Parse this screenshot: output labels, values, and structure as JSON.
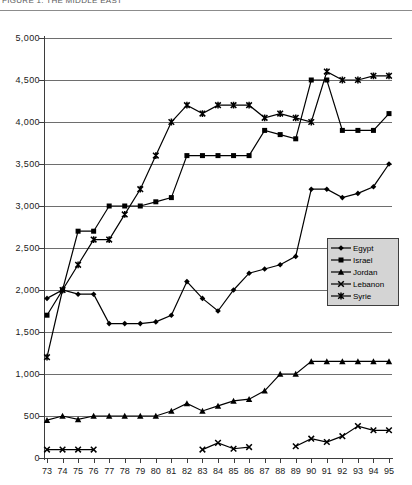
{
  "header": {
    "clipped_title": "FIGURE 1.  THE MIDDLE EAST"
  },
  "legend": {
    "position": "inside-right",
    "items": [
      {
        "label": "Egypt",
        "marker": "diamond-marker"
      },
      {
        "label": "Israel",
        "marker": "square-marker"
      },
      {
        "label": "Jordan",
        "marker": "triangle-marker"
      },
      {
        "label": "Lebanon",
        "marker": "cross-x-marker"
      },
      {
        "label": "Syrie",
        "marker": "asterisk-marker"
      }
    ]
  },
  "chart_data": {
    "type": "line",
    "title": "",
    "xlabel": "",
    "ylabel": "",
    "grid": true,
    "legend_position": "inside-right",
    "xlim": [
      73,
      95
    ],
    "ylim": [
      0,
      5000
    ],
    "ytick_step": 500,
    "ytick_labels": [
      "0",
      "500",
      "1,000",
      "1,500",
      "2,000",
      "2,500",
      "3,000",
      "3,500",
      "4,000",
      "4,500",
      "5,000"
    ],
    "ytick_values": [
      0,
      500,
      1000,
      1500,
      2000,
      2500,
      3000,
      3500,
      4000,
      4500,
      5000
    ],
    "categories": [
      "73",
      "74",
      "75",
      "76",
      "77",
      "78",
      "79",
      "80",
      "81",
      "82",
      "83",
      "84",
      "85",
      "86",
      "87",
      "88",
      "89",
      "90",
      "91",
      "92",
      "93",
      "94",
      "95"
    ],
    "x": [
      73,
      74,
      75,
      76,
      77,
      78,
      79,
      80,
      81,
      82,
      83,
      84,
      85,
      86,
      87,
      88,
      89,
      90,
      91,
      92,
      93,
      94,
      95
    ],
    "series": [
      {
        "name": "Egypt",
        "marker": "diamond-marker",
        "color": "#000000",
        "values": [
          1900,
          2000,
          1950,
          1950,
          1600,
          1600,
          1600,
          1620,
          1700,
          2100,
          1900,
          1750,
          2000,
          2200,
          2250,
          2300,
          2400,
          3200,
          3200,
          3100,
          3150,
          3230,
          3500
        ]
      },
      {
        "name": "Israel",
        "marker": "square-marker",
        "color": "#000000",
        "values": [
          1700,
          2000,
          2700,
          2700,
          3000,
          3000,
          3000,
          3050,
          3100,
          3600,
          3600,
          3600,
          3600,
          3600,
          3900,
          3850,
          3800,
          4500,
          4500,
          3900,
          3900,
          3900,
          4100
        ]
      },
      {
        "name": "Jordan",
        "marker": "triangle-marker",
        "color": "#000000",
        "values": [
          450,
          500,
          460,
          500,
          500,
          500,
          500,
          500,
          560,
          650,
          560,
          620,
          680,
          700,
          800,
          1000,
          1000,
          1150,
          1150,
          1150,
          1150,
          1150,
          1150
        ]
      },
      {
        "name": "Lebanon",
        "marker": "cross-x-marker",
        "color": "#000000",
        "values": [
          100,
          100,
          100,
          100,
          null,
          null,
          null,
          null,
          null,
          null,
          100,
          180,
          110,
          130,
          null,
          null,
          140,
          230,
          190,
          260,
          380,
          330,
          330
        ]
      },
      {
        "name": "Syrie",
        "marker": "asterisk-marker",
        "color": "#000000",
        "values": [
          1200,
          2000,
          2300,
          2600,
          2600,
          2900,
          3200,
          3600,
          4000,
          4200,
          4100,
          4200,
          4200,
          4200,
          4050,
          4100,
          4050,
          4000,
          4600,
          4500,
          4500,
          4550,
          4550
        ]
      }
    ]
  }
}
